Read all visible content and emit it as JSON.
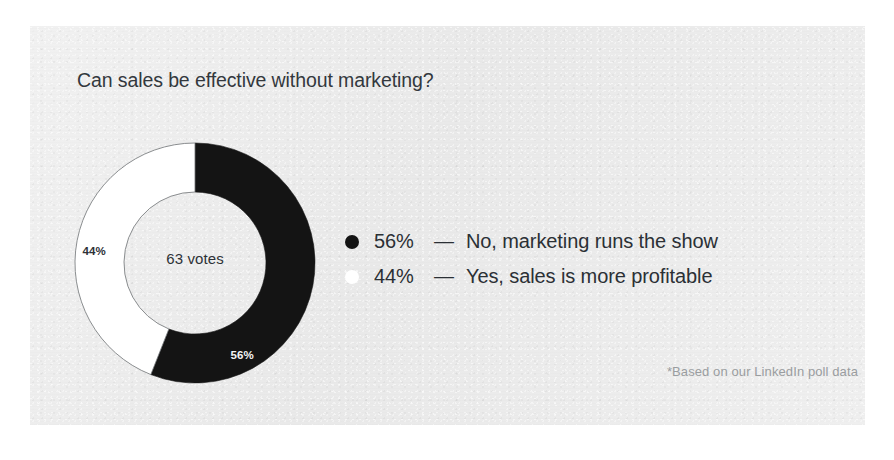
{
  "card": {
    "background_color": "#ececec",
    "page_background_color": "#ffffff"
  },
  "title": "Can sales be effective without marketing?",
  "center": {
    "votes_label": "63 votes"
  },
  "footnote": "*Based on our LinkedIn poll data",
  "legend": {
    "rows": [
      {
        "marker": "dark-dot",
        "percent": "56%",
        "dash": "—",
        "label": "No, marketing runs the show",
        "color": "#141414"
      },
      {
        "marker": "light-dot",
        "percent": "44%",
        "dash": "—",
        "label": "Yes, sales is more profitable",
        "color": "#ffffff"
      }
    ]
  },
  "chart_data": {
    "type": "pie",
    "variant": "donut",
    "title": "Can sales be effective without marketing?",
    "center_text": "63 votes",
    "total_votes": 63,
    "start_angle_deg": 0,
    "direction": "clockwise",
    "outer_radius_px": 120,
    "inner_radius_px": 71,
    "categories": [
      "No, marketing runs the show",
      "Yes, sales is more profitable"
    ],
    "values": [
      56,
      44
    ],
    "units": "percent",
    "colors": [
      "#141414",
      "#ffffff"
    ],
    "slice_labels": [
      {
        "text": "56%",
        "value": 56,
        "position": "inside-ring",
        "text_color": "#f4f4f4",
        "x": 274,
        "y": 297
      },
      {
        "text": "44%",
        "value": 44,
        "position": "inside-ring",
        "text_color": "#2e3237",
        "x": 113,
        "y": 213
      }
    ],
    "legend": [
      "56% — No, marketing runs the show",
      "44% — Yes, sales is more profitable"
    ],
    "legend_position": "right",
    "annotation": "*Based on our LinkedIn poll data",
    "grid": false,
    "xlabel": "",
    "ylabel": ""
  }
}
